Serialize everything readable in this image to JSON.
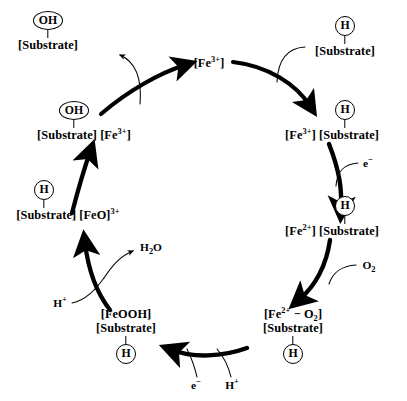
{
  "diagram": {
    "type": "cycle-diagram",
    "background_color": "#ffffff",
    "ink_color": "#000000"
  },
  "nodes": [
    {
      "id": "product",
      "label_lines": [
        "[Substrate]"
      ],
      "marker": "OH",
      "marker_shape": "ellipse",
      "marker_position": "above"
    },
    {
      "id": "fe3-free",
      "label_lines": [
        "[Fe3+]"
      ],
      "marker": null,
      "marker_shape": null,
      "marker_position": null
    },
    {
      "id": "substrate-in",
      "label_lines": [
        "[Substrate]"
      ],
      "marker": "H",
      "marker_shape": "circle",
      "marker_position": "above"
    },
    {
      "id": "fe3-substrate",
      "label_lines": [
        "[Fe3+] [Substrate]"
      ],
      "marker": "H",
      "marker_shape": "circle",
      "marker_position": "above"
    },
    {
      "id": "fe2-substrate",
      "label_lines": [
        "[Fe2+] [Substrate]"
      ],
      "marker": "H",
      "marker_shape": "circle",
      "marker_position": "above"
    },
    {
      "id": "fe2-o2-substrate",
      "label_lines": [
        "[Fe2+ - O2]",
        "[Substrate]"
      ],
      "marker": "H",
      "marker_shape": "circle",
      "marker_position": "below"
    },
    {
      "id": "feooh-substrate",
      "label_lines": [
        "[FeOOH]",
        "[Substrate]"
      ],
      "marker": "H",
      "marker_shape": "circle",
      "marker_position": "below"
    },
    {
      "id": "feo3-substrate",
      "label_lines": [
        "[Substrate] [FeO]3+"
      ],
      "marker": "H",
      "marker_shape": "circle",
      "marker_position": "above"
    },
    {
      "id": "oh-substrate-fe3",
      "label_lines": [
        "[Substrate] [Fe3+]"
      ],
      "marker": "OH",
      "marker_shape": "ellipse",
      "marker_position": "above"
    }
  ],
  "labels": {
    "product_substrate": "[Substrate]",
    "product_marker": "OH",
    "fe3_free": "[Fe",
    "fe3_free_sup": "3+",
    "fe3_free_end": "]",
    "substrate_in": "[Substrate]",
    "substrate_in_marker": "H",
    "fe3_substrate_pre": "[Fe",
    "fe3_substrate_sup": "3+",
    "fe3_substrate_post": "] [Substrate]",
    "fe3_substrate_marker": "H",
    "fe2_substrate_pre": "[Fe",
    "fe2_substrate_sup": "2+",
    "fe2_substrate_post": "] [Substrate]",
    "fe2_substrate_marker": "H",
    "fe2o2_line1_pre": "[Fe",
    "fe2o2_line1_sup": "2+",
    "fe2o2_line1_mid": " − O",
    "fe2o2_line1_sub": "2",
    "fe2o2_line1_post": "]",
    "fe2o2_line2": "[Substrate]",
    "fe2o2_marker": "H",
    "feooh_line1": "[FeOOH]",
    "feooh_line2": "[Substrate]",
    "feooh_marker": "H",
    "feo3_pre": "[Substrate] [FeO]",
    "feo3_sup": "3+",
    "feo3_marker": "H",
    "ohsub_fe3_pre": "[Substrate] [Fe",
    "ohsub_fe3_sup": "3+",
    "ohsub_fe3_post": "]",
    "ohsub_fe3_marker": "OH"
  },
  "cofactors": [
    {
      "id": "electron-right",
      "text": "e",
      "sup": "−"
    },
    {
      "id": "dioxygen",
      "text": "O",
      "sub": "2"
    },
    {
      "id": "electron-bottom",
      "text": "e",
      "sup": "−"
    },
    {
      "id": "proton-bottom",
      "text": "H",
      "sup": "+"
    },
    {
      "id": "proton-left",
      "text": "H",
      "sup": "+"
    },
    {
      "id": "water",
      "text": "H",
      "sub": "2",
      "text_end": "O"
    }
  ],
  "cofactor_text": {
    "electron_right_base": "e",
    "electron_right_sup": "−",
    "o2_base": "O",
    "o2_sub": "2",
    "electron_bottom_base": "e",
    "electron_bottom_sup": "−",
    "proton_bottom_base": "H",
    "proton_bottom_sup": "+",
    "proton_left_base": "H",
    "proton_left_sup": "+",
    "water_base": "H",
    "water_sub": "2",
    "water_end": "O"
  }
}
